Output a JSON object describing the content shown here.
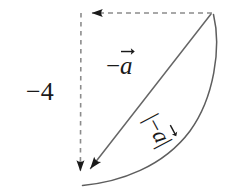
{
  "figure": {
    "type": "vector-diagram",
    "canvas": {
      "width": 227,
      "height": 195,
      "background": "#ffffff"
    },
    "colors": {
      "dashed_stroke": "#8c8c8c",
      "solid_stroke": "#666666",
      "arrowhead_fill": "#1a1a1a",
      "text": "#1a1a1a"
    },
    "vertices": {
      "top_left": {
        "x": 81,
        "y": 13
      },
      "top_right": {
        "x": 212,
        "y": 13
      },
      "bottom_left": {
        "x": 80,
        "y": 182
      }
    },
    "labels": {
      "scalar": "−4",
      "vector_minus_a_sign": "−",
      "vector_minus_a_letter": "a",
      "magnitude_open_bar": "|",
      "magnitude_sign": "−",
      "magnitude_letter": "a",
      "magnitude_close_bar": "|"
    },
    "segments": [
      {
        "name": "top-dashed-segment",
        "style": "dashed",
        "from": {
          "x": 212,
          "y": 13
        },
        "to": {
          "x": 81,
          "y": 13
        },
        "arrowhead_at": "to",
        "arrow_direction": "left"
      },
      {
        "name": "left-dashed-segment",
        "style": "dashed",
        "from": {
          "x": 81,
          "y": 13
        },
        "to": {
          "x": 80,
          "y": 182
        },
        "arrowhead_at": "to",
        "arrow_direction": "down"
      },
      {
        "name": "hypotenuse-vector",
        "style": "solid",
        "from": {
          "x": 212,
          "y": 13
        },
        "to": {
          "x": 80,
          "y": 182
        },
        "arrowhead_at": "to",
        "arrow_direction": "down-left"
      },
      {
        "name": "magnitude-arc",
        "style": "solid-curved",
        "from": {
          "x": 213,
          "y": 15
        },
        "to": {
          "x": 83,
          "y": 185
        },
        "bulge": "outward-right"
      }
    ]
  }
}
